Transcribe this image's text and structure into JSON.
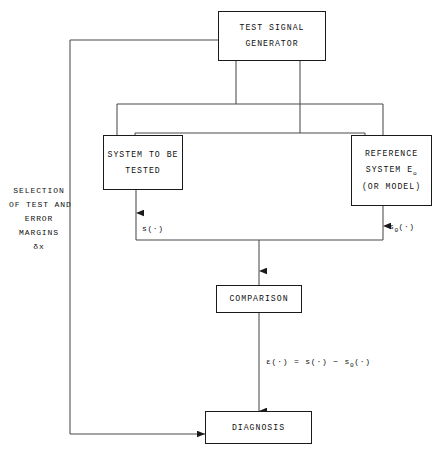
{
  "diagram": {
    "title_present": false,
    "colors": {
      "ink": "#111111",
      "line": "#3a3a3a",
      "background": "#ffffff"
    },
    "boxes": {
      "generator": {
        "lines": [
          "TEST SIGNAL",
          "GENERATOR"
        ]
      },
      "system_under_test": {
        "lines": [
          "SYSTEM TO BE",
          "TESTED"
        ]
      },
      "reference": {
        "line1": "REFERENCE",
        "line2_prefix": "SYSTEM E",
        "line2_subscript": "o",
        "line3": "(OR MODEL)"
      },
      "comparison": {
        "lines": [
          "COMPARISON"
        ]
      },
      "diagnosis": {
        "lines": [
          "DIAGNOSIS"
        ]
      }
    },
    "annotations": {
      "selection_block": [
        "SELECTION",
        "OF TEST AND",
        "ERROR",
        "MARGINS",
        "δx"
      ],
      "signal_left": {
        "text": "s(·)"
      },
      "signal_right": {
        "prefix": "s",
        "subscript": "0",
        "suffix": "(·)"
      },
      "error_equation": {
        "lhs": "ε(·)  =  s(·)  −  s",
        "subscript": "0",
        "tail": "(·)"
      }
    }
  }
}
